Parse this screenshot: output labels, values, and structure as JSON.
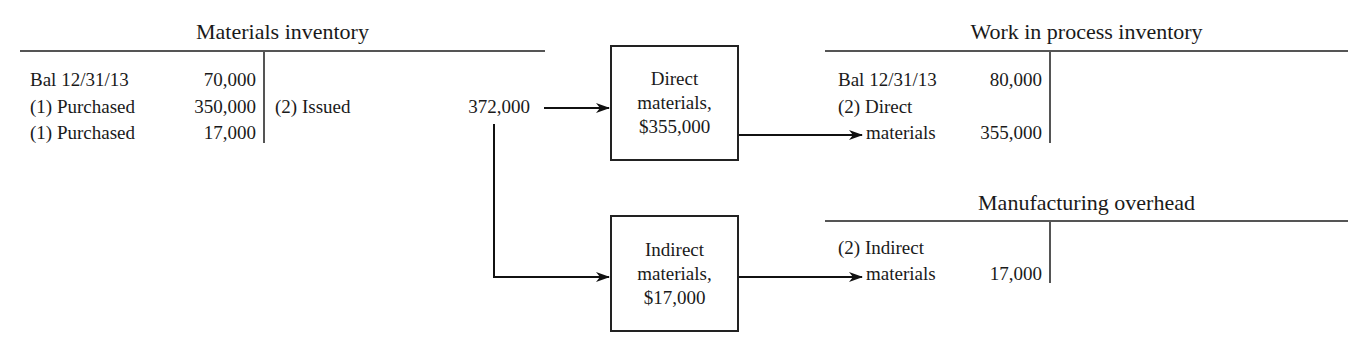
{
  "materials_inventory": {
    "title": "Materials inventory",
    "debits": [
      {
        "label": "Bal 12/31/13",
        "amount": "70,000"
      },
      {
        "label": "(1) Purchased",
        "amount": "350,000"
      },
      {
        "label": "(1) Purchased",
        "amount": "17,000"
      }
    ],
    "credits": [
      {
        "label": "(2) Issued",
        "amount": "372,000"
      }
    ]
  },
  "direct_box": {
    "line1": "Direct",
    "line2": "materials,",
    "line3": "$355,000"
  },
  "indirect_box": {
    "line1": "Indirect",
    "line2": "materials,",
    "line3": "$17,000"
  },
  "wip_inventory": {
    "title": "Work in process inventory",
    "debits": [
      {
        "label": "Bal 12/31/13",
        "amount": "80,000"
      },
      {
        "label": "(2) Direct",
        "label2": "materials",
        "amount": "355,000"
      }
    ]
  },
  "manufacturing_overhead": {
    "title": "Manufacturing overhead",
    "debits": [
      {
        "label": "(2) Indirect",
        "label2": "materials",
        "amount": "17,000"
      }
    ]
  },
  "colors": {
    "line": "#555555",
    "text": "#1a1a1a",
    "arrow": "#111111"
  }
}
